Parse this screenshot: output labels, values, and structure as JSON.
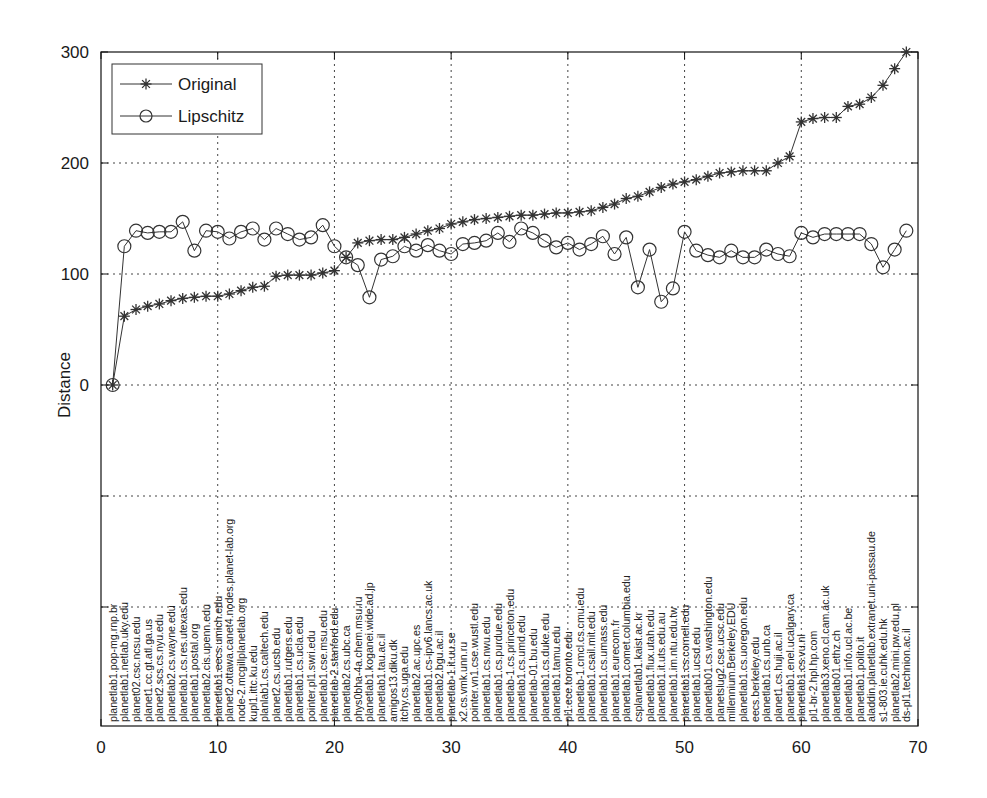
{
  "chart_data": {
    "type": "line",
    "title": "",
    "xlabel": "",
    "ylabel": "Distance",
    "xlim": [
      0,
      70
    ],
    "ylim": [
      -307,
      300
    ],
    "grid": true,
    "legend_position": "upper left",
    "x_ticks": [
      0,
      10,
      20,
      30,
      40,
      50,
      60,
      70
    ],
    "y_ticks": [
      0,
      100,
      200,
      300
    ],
    "y_gridlines_unlabeled": [
      -100,
      -200
    ],
    "x": [
      1,
      2,
      3,
      4,
      5,
      6,
      7,
      8,
      9,
      10,
      11,
      12,
      13,
      14,
      15,
      16,
      17,
      18,
      19,
      20,
      21,
      22,
      23,
      24,
      25,
      26,
      27,
      28,
      29,
      30,
      31,
      32,
      33,
      34,
      35,
      36,
      37,
      38,
      39,
      40,
      41,
      42,
      43,
      44,
      45,
      46,
      47,
      48,
      49,
      50,
      51,
      52,
      53,
      54,
      55,
      56,
      57,
      58,
      59,
      60,
      61,
      62,
      63,
      64,
      65,
      66,
      67,
      68,
      69
    ],
    "series": [
      {
        "name": "Original",
        "marker": "asterisk",
        "values": [
          0,
          62,
          68,
          71,
          73,
          76,
          78,
          79,
          80,
          80,
          82,
          85,
          88,
          89,
          98,
          99,
          99,
          99,
          101,
          103,
          115,
          128,
          130,
          131,
          131,
          133,
          136,
          139,
          141,
          145,
          147,
          149,
          150,
          151,
          152,
          153,
          153,
          154,
          155,
          155,
          156,
          157,
          160,
          163,
          168,
          170,
          174,
          178,
          181,
          183,
          185,
          188,
          191,
          192,
          193,
          193,
          193,
          200,
          206,
          237,
          240,
          241,
          241,
          251,
          253,
          259,
          270,
          285,
          300
        ]
      },
      {
        "name": "Lipschitz",
        "marker": "circle",
        "values": [
          0,
          125,
          139,
          137,
          138,
          138,
          147,
          121,
          139,
          138,
          132,
          138,
          141,
          131,
          141,
          136,
          131,
          133,
          144,
          125,
          115,
          108,
          79,
          113,
          116,
          125,
          121,
          126,
          121,
          118,
          127,
          128,
          130,
          137,
          129,
          141,
          137,
          130,
          124,
          128,
          122,
          127,
          134,
          118,
          133,
          88,
          122,
          75,
          87,
          138,
          121,
          117,
          115,
          121,
          115,
          115,
          122,
          118,
          116,
          137,
          133,
          136,
          136,
          136,
          136,
          127,
          106,
          122,
          139
        ]
      }
    ],
    "host_labels": [
      "planetlab1.pop-mg.rnp.br",
      "planetlab1.netlab.uky.edu",
      "planet02.csc.ncsu.edu",
      "planet1.cc.gt.atl.ga.us",
      "planet2.scs.cs.nyu.edu",
      "planetlab2.cs.wayne.edu",
      "planetlab1.cs.res.utexas.edu",
      "planetlab1.postal.org",
      "planetlab2.cis.upenn.edu",
      "planetlab1.eecs.umich.edu",
      "planet2.ottawa.canet4.nodes.planet-lab.org",
      "node-2.mcgillplanetlab.org",
      "kupl1.ittc.ku.edu",
      "planlab1.cs.caltech.edu",
      "planet2.cs.ucsb.edu",
      "planetlab1.rutgers.edu",
      "planetlab1.cs.ucla.edu",
      "pointer.pl1.swri.edu",
      "planetlab1.cse.msu.edu",
      "planetlab-2.stanford.edu",
      "planetlab2.cs.ubc.ca",
      "phys0bha-4a.chem.msu.ru",
      "planetlab1.koganei.wide.ad.jp",
      "planetlab1.tau.ac.il",
      "amigos13.diku.dk",
      "itchy.cs.uga.edu",
      "planetlab2.ac.upc.es",
      "planetlab1.cs-ipv6.lancs.ac.uk",
      "planetlab2.bgu.ac.il",
      "planetlab-1.it.uu.se",
      "x2.cs.vmk.unn.ru",
      "pointer.vn1.cse.wustl.edu",
      "planetlab1.cs.nwu.edu",
      "planetlab1.cs.purdue.edu",
      "planetlab-1.cs.princeton.edu",
      "planetlab1.cs.umd.edu",
      "planetlab-01.bu.edu",
      "planetlab1.cs.duke.edu",
      "planetlab1.tamu.edu",
      "pl1.ece.toronto.edu",
      "planetlab-1.cmcl.cs.cmu.edu",
      "planetlab1.csail.mit.edu",
      "planetlab1.cs.umass.edu",
      "planetlab1.eurecom.fr",
      "planetlab1.comet.columbia.edu",
      "csplanetlab1.kaist.ac.kr",
      "planetlab1.flux.utah.edu",
      "planetlab1.it.uts.edu.au",
      "planetlab1.im.ntu.edu.tw",
      "planetlab1.cs.cornell.edu",
      "planetlab1.ucsd.edu",
      "planetlab01.cs.washington.edu",
      "planetslug2.cse.ucsc.edu",
      "millennium.Berkeley.EDU",
      "planetlab1.cs.uoregon.edu",
      "eecs.berkeley.edu",
      "planetlab1.cs.unb.ca",
      "planet1.cs.huji.ac.il",
      "planetlab1.enel.ucalgary.ca",
      "planetlab1.cs.vu.nl",
      "pl1-br-2.hpl.hp.com",
      "planetlab3.xeno.cl.cam.ac.uk",
      "planetlab01.ethz.ch",
      "planetlab1.info.ucl.ac.be",
      "planetlab1.polito.it",
      "aladdin.planetlab.extranet.uni-passau.de",
      "s1-803.ie.cuhk.edu.hk",
      "planetlab2.mini.pw.edu.pl",
      "ds-pl1.technion.ac.il"
    ]
  },
  "legend": {
    "items": [
      {
        "label": "Original",
        "marker": "asterisk-icon"
      },
      {
        "label": "Lipschitz",
        "marker": "circle-icon"
      }
    ]
  },
  "axes": {
    "ylabel": "Distance",
    "x_tick_labels": [
      "0",
      "10",
      "20",
      "30",
      "40",
      "50",
      "60",
      "70"
    ],
    "y_tick_labels": [
      "0",
      "100",
      "200",
      "300"
    ]
  },
  "colors": {
    "line": "#333333",
    "grid": "#444444",
    "axis": "#111111",
    "background": "#ffffff"
  }
}
